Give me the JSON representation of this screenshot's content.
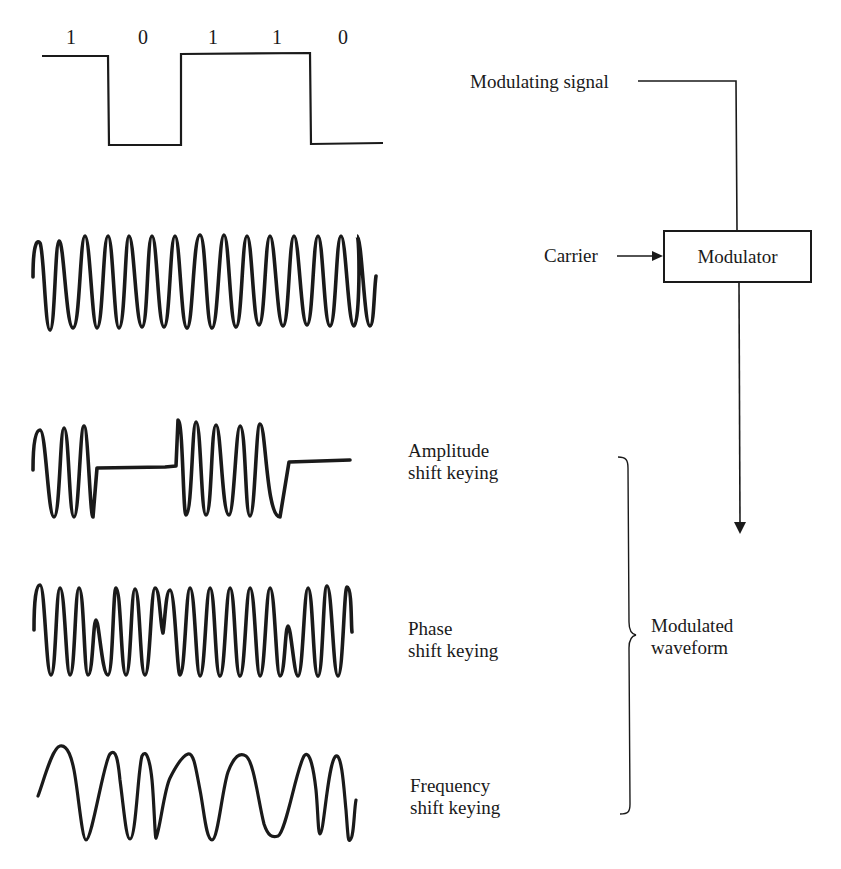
{
  "modulating_signal": {
    "label": "Modulating signal",
    "bits": [
      "1",
      "0",
      "1",
      "1",
      "0"
    ]
  },
  "carrier": {
    "label": "Carrier"
  },
  "modulator": {
    "label": "Modulator"
  },
  "waveforms": [
    {
      "id": "ask",
      "label_line1": "Amplitude",
      "label_line2": "shift keying"
    },
    {
      "id": "psk",
      "label_line1": "Phase",
      "label_line2": "shift keying"
    },
    {
      "id": "fsk",
      "label_line1": "Frequency",
      "label_line2": "shift keying"
    }
  ],
  "output": {
    "label_line1": "Modulated",
    "label_line2": "waveform"
  },
  "colors": {
    "ink": "#1a1a1a",
    "background": "#ffffff"
  }
}
